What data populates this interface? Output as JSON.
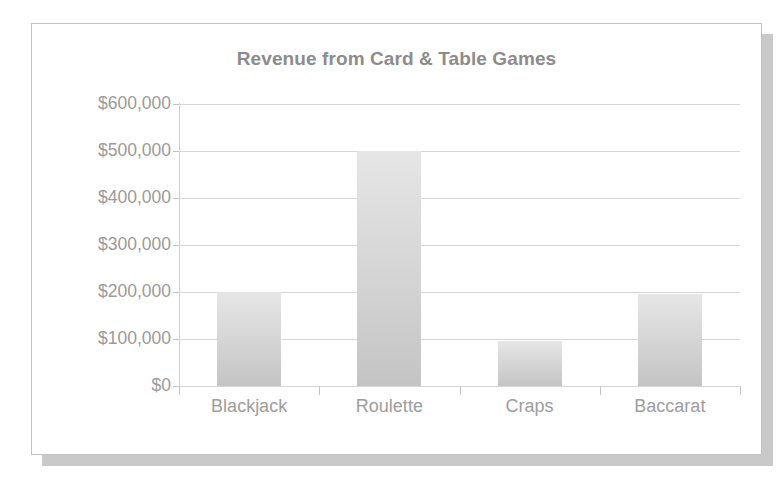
{
  "card": {
    "background": "#ffffff",
    "border_color": "#c2c2c2",
    "shadow_color": "#c9c9c9"
  },
  "chart_data": {
    "type": "bar",
    "title": "Revenue from Card & Table Games",
    "xlabel": "",
    "ylabel": "",
    "categories": [
      "Blackjack",
      "Roulette",
      "Craps",
      "Baccarat"
    ],
    "values": [
      200000,
      500000,
      95000,
      195000
    ],
    "ytick_labels": [
      "$600,000",
      "$500,000",
      "$400,000",
      "$300,000",
      "$200,000",
      "$100,000",
      "$0"
    ],
    "ytick_values": [
      600000,
      500000,
      400000,
      300000,
      200000,
      100000,
      0
    ],
    "ylim": [
      0,
      600000
    ],
    "grid": true,
    "legend": "none",
    "bar_color": "#d4d4d4",
    "bar_color_top": "#e6e6e6",
    "bar_color_bottom": "#c4c4c4",
    "gridline_color": "#d6d6d6",
    "axis_color": "#c4c4c4",
    "title_color": "#8c8c8c",
    "tick_label_color": "#9a9a9a"
  }
}
